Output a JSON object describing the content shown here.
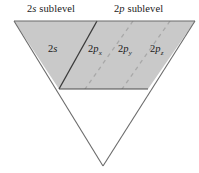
{
  "figure": {
    "title_2s": {
      "prefix": "2",
      "italic": "s",
      "suffix": " sublevel"
    },
    "title_2p": {
      "prefix": "2",
      "italic": "p",
      "suffix": " sublevel"
    },
    "headings": [
      {
        "id": "2s-sublevel",
        "text": "2s sublevel"
      },
      {
        "id": "2p-sublevel",
        "text": "2p sublevel"
      }
    ],
    "orbitals": [
      {
        "id": "2s",
        "prefix": "2",
        "italic": "s",
        "subscript": ""
      },
      {
        "id": "2px",
        "prefix": "2",
        "italic": "p",
        "subscript": "x"
      },
      {
        "id": "2py",
        "prefix": "2",
        "italic": "p",
        "subscript": "y"
      },
      {
        "id": "2pz",
        "prefix": "2",
        "italic": "p",
        "subscript": "z"
      }
    ],
    "colors": {
      "shaded_fill": "#c9c9c9",
      "outline": "#555555",
      "divider_solid": "#3a3a3a",
      "divider_dashed": "#a8a8a8",
      "text": "#1a1a1a",
      "background": "#ffffff"
    },
    "geometry": {
      "apex_x": 103,
      "apex_y": 166,
      "top_left_x": 14,
      "top_right_x": 195,
      "top_y": 21,
      "shaded_bottom_y": 89,
      "shaded_bottom_left_x": 59,
      "shaded_bottom_right_x": 148,
      "solid_divider_top_x": 97,
      "solid_divider_bottom_x": 59,
      "dashed_divider_top_xs": [
        133,
        170
      ],
      "dashed_divider_bottom_xs": [
        78,
        96
      ]
    }
  }
}
